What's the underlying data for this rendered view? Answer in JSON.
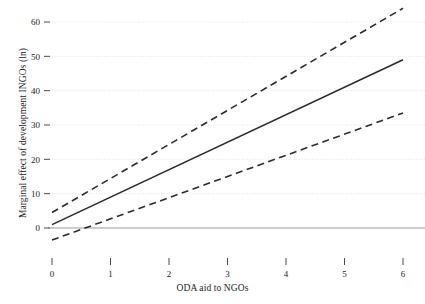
{
  "chart_data": {
    "type": "line",
    "title": "",
    "xlabel": "ODA aid to NGOs",
    "ylabel": "Marginal effect of development INGOs (ln)",
    "xlim": [
      0,
      6.5
    ],
    "ylim": [
      -8,
      66
    ],
    "xticks": [
      0,
      1,
      2,
      3,
      4,
      5,
      6
    ],
    "xticklabels": [
      "0",
      "1",
      "2",
      "3",
      "4",
      "5",
      "6"
    ],
    "yticks": [
      0,
      10,
      20,
      30,
      40,
      50,
      60
    ],
    "yticklabels": [
      "0",
      "10",
      "20",
      "30",
      "40",
      "50",
      "60"
    ],
    "grid": "horizontal-dotted",
    "legend": "none",
    "zero_reference_line": 0,
    "series": [
      {
        "name": "Marginal effect",
        "style": "solid",
        "color": "#2b2b2b",
        "x": [
          0,
          6
        ],
        "values": [
          1.0,
          49.0
        ]
      },
      {
        "name": "Upper 95% confidence bound",
        "style": "dashed",
        "color": "#2b2b2b",
        "x": [
          0,
          6
        ],
        "values": [
          4.5,
          64.0
        ]
      },
      {
        "name": "Lower 95% confidence bound",
        "style": "dashed",
        "color": "#2b2b2b",
        "x": [
          0,
          6
        ],
        "values": [
          -3.5,
          33.5
        ]
      }
    ]
  },
  "colors": {
    "line": "#2b2b2b",
    "grid": "#e3e3e3",
    "zero_line": "#9a9a9a",
    "text": "#1b1b1b",
    "background": "#ffffff"
  }
}
